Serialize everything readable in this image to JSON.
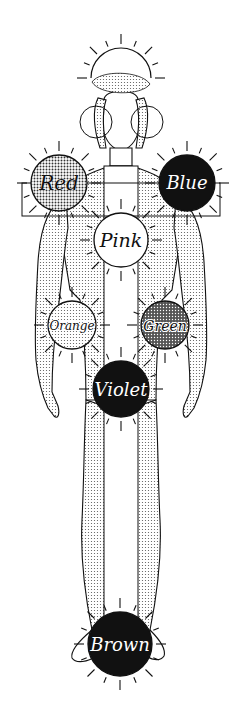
{
  "diagram": {
    "colors": {
      "ink": "#111111",
      "paper": "#ffffff",
      "stipple_light": "#d9d9d9",
      "stipple_mid": "#a9a9a9",
      "stipple_dark": "#6e6e6e"
    },
    "circles": [
      {
        "id": "crown",
        "label": "",
        "cx": 121,
        "cy": 78,
        "r": 30,
        "fill": "white"
      },
      {
        "id": "red",
        "label": "Red",
        "cx": 59,
        "cy": 183,
        "r": 28,
        "fill": "stipple_mid"
      },
      {
        "id": "blue",
        "label": "Blue",
        "cx": 187,
        "cy": 183,
        "r": 28,
        "fill": "black"
      },
      {
        "id": "pink",
        "label": "Pink",
        "cx": 121,
        "cy": 240,
        "r": 27,
        "fill": "white"
      },
      {
        "id": "orange",
        "label": "Orange",
        "cx": 72,
        "cy": 325,
        "r": 24,
        "fill": "stipple_light"
      },
      {
        "id": "green",
        "label": "Green",
        "cx": 165,
        "cy": 325,
        "r": 24,
        "fill": "stipple_dark"
      },
      {
        "id": "violet",
        "label": "Violet",
        "cx": 121,
        "cy": 389,
        "r": 28,
        "fill": "black"
      },
      {
        "id": "brown",
        "label": "Brown",
        "cx": 120,
        "cy": 644,
        "r": 32,
        "fill": "black"
      }
    ],
    "labels": {
      "red": "Red",
      "blue": "Blue",
      "pink": "Pink",
      "orange": "Orange",
      "green": "Green",
      "violet": "Violet",
      "brown": "Brown"
    }
  }
}
